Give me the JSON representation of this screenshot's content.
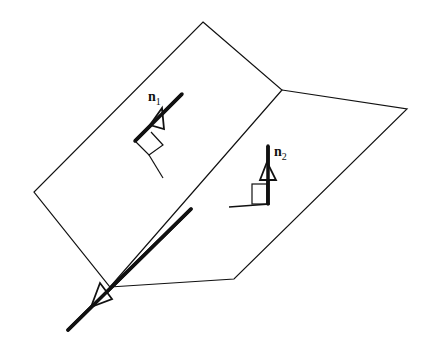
{
  "diagram": {
    "title": "",
    "labels": {
      "n1": {
        "main": "n",
        "sub": "1"
      },
      "n2": {
        "main": "n",
        "sub": "2"
      }
    },
    "elements": [
      "plane-1",
      "plane-2",
      "intersection-line",
      "normal-vector-n1",
      "normal-vector-n2",
      "right-angle-markers"
    ],
    "colors": {
      "stroke": "#111111",
      "background": "#ffffff"
    }
  }
}
